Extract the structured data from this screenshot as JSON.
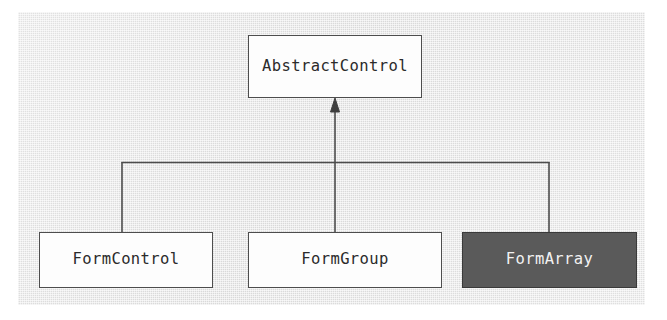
{
  "diagram": {
    "type": "class-inheritance-hierarchy",
    "canvas": {
      "background_color": "#e3e3e3",
      "page_background_color": "#ffffff"
    },
    "style": {
      "box_fill": "#fdfdfd",
      "box_border": "#4d4d4d",
      "highlight_fill": "#5a5a5a",
      "highlight_text": "#f2f2f2",
      "text_color": "#2b2b2b",
      "connector_color": "#4d4d4d"
    },
    "nodes": [
      {
        "id": "abstractcontrol",
        "label": "AbstractControl",
        "role": "base-class",
        "highlighted": false
      },
      {
        "id": "formcontrol",
        "label": "FormControl",
        "role": "derived-class",
        "highlighted": false
      },
      {
        "id": "formgroup",
        "label": "FormGroup",
        "role": "derived-class",
        "highlighted": false
      },
      {
        "id": "formarray",
        "label": "FormArray",
        "role": "derived-class",
        "highlighted": true
      }
    ],
    "edges": [
      {
        "id": "edge-formcontrol",
        "from": "formcontrol",
        "to": "abstractcontrol",
        "kind": "inheritance",
        "arrow": "closed-triangle"
      },
      {
        "id": "edge-formgroup",
        "from": "formgroup",
        "to": "abstractcontrol",
        "kind": "inheritance",
        "arrow": "closed-triangle"
      },
      {
        "id": "edge-formarray",
        "from": "formarray",
        "to": "abstractcontrol",
        "kind": "inheritance",
        "arrow": "closed-triangle"
      }
    ]
  }
}
